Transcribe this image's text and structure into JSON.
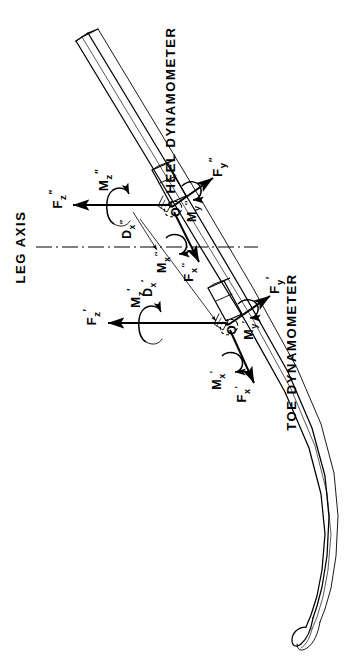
{
  "figure": {
    "type": "engineering-line-diagram",
    "orientation": "landscape drawing rotated 90 degrees counter-clockwise within a portrait frame",
    "background_color": "#ffffff",
    "line_color": "#000000"
  },
  "captions": {
    "heel_dynamometer": "HEEL DYNAMOMETER",
    "toe_dynamometer": "TOE DYNAMOMETER",
    "leg_axis": "LEG AXIS"
  },
  "origins": [
    {
      "id": "heel-origin",
      "label": "O",
      "prime": "″",
      "belongs_to": "heel dynamometer"
    },
    {
      "id": "toe-origin",
      "label": "O",
      "prime": "′",
      "belongs_to": "toe dynamometer"
    }
  ],
  "heel_dynamometer": {
    "caption": "HEEL DYNAMOMETER",
    "origin_label": "O″",
    "vectors": [
      {
        "name": "F",
        "sub": "z",
        "prime": "″",
        "full": "F″z",
        "kind": "force",
        "direction": "left (vertical axis of ski frame)"
      },
      {
        "name": "F",
        "sub": "y",
        "prime": "″",
        "full": "F″y",
        "kind": "force",
        "direction": "up-right (lateral)"
      },
      {
        "name": "F",
        "sub": "x",
        "prime": "″",
        "full": "F″x",
        "kind": "force",
        "direction": "down-right along ski long axis"
      },
      {
        "name": "M",
        "sub": "z",
        "prime": "″",
        "full": "M″z",
        "kind": "moment",
        "direction": "about z axis"
      },
      {
        "name": "M",
        "sub": "y",
        "prime": "″",
        "full": "M″y",
        "kind": "moment",
        "direction": "about y axis"
      },
      {
        "name": "M",
        "sub": "x",
        "prime": "″",
        "full": "M″x",
        "kind": "moment",
        "direction": "about x axis"
      }
    ],
    "dimension": {
      "name": "D",
      "sub": "x",
      "prime": "″",
      "full": "D″x",
      "kind": "distance",
      "measured_from": "LEG AXIS",
      "measured_to": "O″"
    }
  },
  "toe_dynamometer": {
    "caption": "TOE DYNAMOMETER",
    "origin_label": "O′",
    "vectors": [
      {
        "name": "F",
        "sub": "z",
        "prime": "′",
        "full": "F′z",
        "kind": "force",
        "direction": "left (vertical axis of ski frame)"
      },
      {
        "name": "F",
        "sub": "y",
        "prime": "′",
        "full": "F′y",
        "kind": "force",
        "direction": "up-right (lateral)"
      },
      {
        "name": "F",
        "sub": "x",
        "prime": "′",
        "full": "F′x",
        "kind": "force",
        "direction": "down-right along ski long axis"
      },
      {
        "name": "M",
        "sub": "z",
        "prime": "′",
        "full": "M′z",
        "kind": "moment",
        "direction": "about z axis"
      },
      {
        "name": "M",
        "sub": "y",
        "prime": "′",
        "full": "M′y",
        "kind": "moment",
        "direction": "about y axis"
      },
      {
        "name": "M",
        "sub": "x",
        "prime": "′",
        "full": "M′x",
        "kind": "moment",
        "direction": "about x axis"
      }
    ],
    "dimension": {
      "name": "D",
      "sub": "x",
      "prime": "′",
      "full": "D′x",
      "kind": "distance",
      "measured_from": "LEG AXIS",
      "measured_to": "O′"
    }
  },
  "reference_line": {
    "label": "LEG AXIS",
    "style": "dash-dot centerline",
    "orientation": "horizontal"
  },
  "ski": {
    "description": "Long slender ski body drawn in perspective with an upturned tip (shovel) at the lower right and a squared tail at the upper left",
    "tip_position": "bottom-right",
    "tail_position": "top-left"
  }
}
